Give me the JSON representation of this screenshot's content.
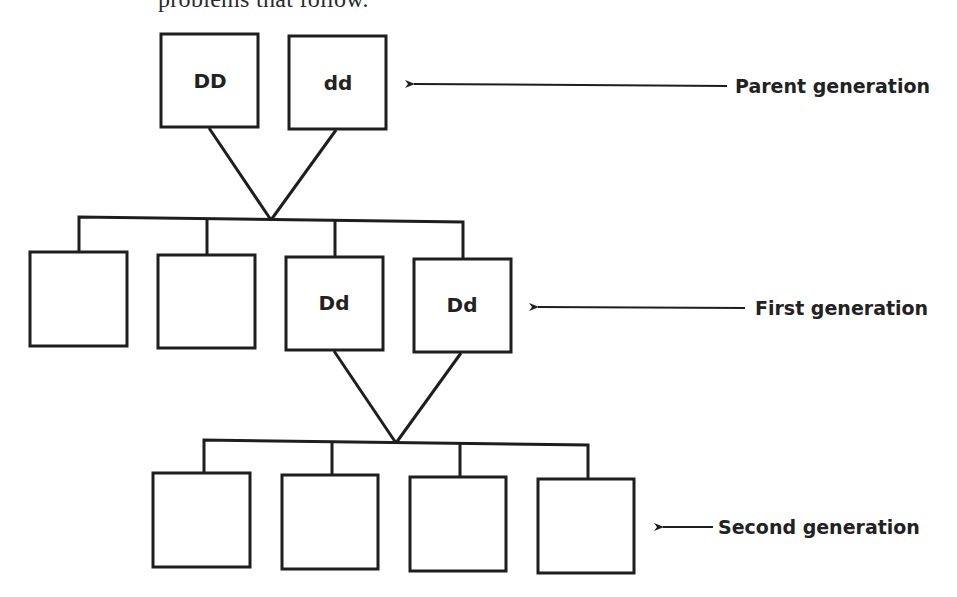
{
  "header": {
    "text": "problems that follow."
  },
  "diagram": {
    "stroke_color": "#1e1e1e",
    "parent_generation": {
      "label": "Parent generation",
      "boxes": [
        {
          "genotype": "DD"
        },
        {
          "genotype": "dd"
        }
      ]
    },
    "first_generation": {
      "label": "First generation",
      "boxes": [
        {
          "genotype": ""
        },
        {
          "genotype": ""
        },
        {
          "genotype": "Dd"
        },
        {
          "genotype": "Dd"
        }
      ]
    },
    "second_generation": {
      "label": "Second generation",
      "boxes": [
        {
          "genotype": ""
        },
        {
          "genotype": ""
        },
        {
          "genotype": ""
        },
        {
          "genotype": ""
        }
      ]
    }
  }
}
